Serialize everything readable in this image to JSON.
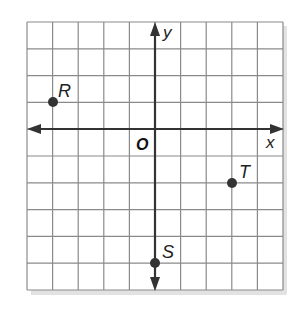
{
  "figure": {
    "type": "coordinate-plane",
    "grid": {
      "x_min": -5,
      "x_max": 5,
      "y_min": -4,
      "y_max": 6,
      "step": 1
    },
    "axes": {
      "x_label": "x",
      "y_label": "y",
      "origin_label": "O"
    },
    "points": [
      {
        "name": "R",
        "x": -4,
        "y": 1
      },
      {
        "name": "T",
        "x": 3,
        "y": -2
      },
      {
        "name": "S",
        "x": 0,
        "y": -5
      }
    ],
    "colors": {
      "grid": "#8a8a8a",
      "axis": "#333333",
      "point": "#333333",
      "shadow": "#d4d4d4"
    }
  }
}
